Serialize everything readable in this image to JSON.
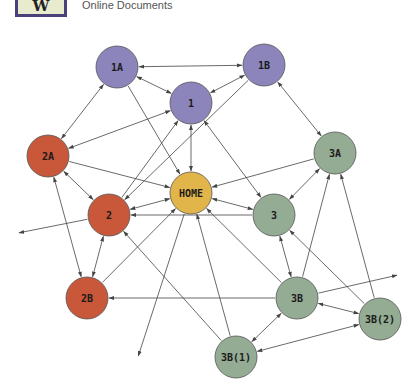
{
  "header": {
    "logo_letter": "W",
    "subtitle": "Online Documents"
  },
  "colors": {
    "purple": "#8c85bb",
    "red": "#c9573a",
    "yellow": "#e2b54a",
    "green": "#93ac93",
    "edge": "#444444",
    "outline": "#555555"
  },
  "nodes": [
    {
      "id": "1A",
      "label": "1A",
      "x": 117,
      "y": 67,
      "color": "purple"
    },
    {
      "id": "1B",
      "label": "1B",
      "x": 264,
      "y": 65,
      "color": "purple"
    },
    {
      "id": "1",
      "label": "1",
      "x": 191,
      "y": 103,
      "color": "purple"
    },
    {
      "id": "2A",
      "label": "2A",
      "x": 48,
      "y": 156,
      "color": "red"
    },
    {
      "id": "3A",
      "label": "3A",
      "x": 335,
      "y": 153,
      "color": "green"
    },
    {
      "id": "HOME",
      "label": "HOME",
      "x": 191,
      "y": 193,
      "color": "yellow"
    },
    {
      "id": "2",
      "label": "2",
      "x": 109,
      "y": 215,
      "color": "red"
    },
    {
      "id": "3",
      "label": "3",
      "x": 274,
      "y": 215,
      "color": "green"
    },
    {
      "id": "2B",
      "label": "2B",
      "x": 87,
      "y": 298,
      "color": "red"
    },
    {
      "id": "3B",
      "label": "3B",
      "x": 297,
      "y": 298,
      "color": "green"
    },
    {
      "id": "3B(2)",
      "label": "3B(2)",
      "x": 380,
      "y": 319,
      "color": "green"
    },
    {
      "id": "3B(1)",
      "label": "3B(1)",
      "x": 236,
      "y": 357,
      "color": "green"
    }
  ],
  "edges": [
    {
      "from": "1B",
      "to": "1A",
      "type": "both"
    },
    {
      "from": "1A",
      "to": "1",
      "type": "both"
    },
    {
      "from": "1B",
      "to": "1",
      "type": "both"
    },
    {
      "from": "1A",
      "to": "2A",
      "type": "both"
    },
    {
      "from": "1A",
      "to": "HOME",
      "type": "to"
    },
    {
      "from": "2A",
      "to": "1",
      "type": "both"
    },
    {
      "from": "1",
      "to": "HOME",
      "type": "both"
    },
    {
      "from": "1B",
      "to": "3A",
      "type": "both"
    },
    {
      "from": "1B",
      "to": "2",
      "type": "to"
    },
    {
      "from": "1",
      "to": "3",
      "type": "both"
    },
    {
      "from": "2A",
      "to": "HOME",
      "type": "to"
    },
    {
      "from": "2A",
      "to": "2",
      "type": "both"
    },
    {
      "from": "3A",
      "to": "HOME",
      "type": "to"
    },
    {
      "from": "3A",
      "to": "3",
      "type": "both"
    },
    {
      "from": "HOME",
      "to": "2",
      "type": "both"
    },
    {
      "from": "HOME",
      "to": "3",
      "type": "both"
    },
    {
      "from": "2",
      "to": "1",
      "type": "to"
    },
    {
      "from": "3",
      "to": "2",
      "type": "to"
    },
    {
      "from": "2",
      "to": "ext-left",
      "type": "to"
    },
    {
      "from": "2B",
      "to": "2A",
      "type": "both"
    },
    {
      "from": "2B",
      "to": "2",
      "type": "both"
    },
    {
      "from": "2B",
      "to": "HOME",
      "type": "to"
    },
    {
      "from": "3B",
      "to": "2B",
      "type": "to"
    },
    {
      "from": "3B",
      "to": "3",
      "type": "both"
    },
    {
      "from": "3B",
      "to": "3A",
      "type": "to"
    },
    {
      "from": "3B",
      "to": "HOME",
      "type": "to"
    },
    {
      "from": "3B",
      "to": "ext-right",
      "type": "to"
    },
    {
      "from": "3B",
      "to": "3B(2)",
      "type": "both"
    },
    {
      "from": "3B",
      "to": "3B(1)",
      "type": "both"
    },
    {
      "from": "3B(2)",
      "to": "3A",
      "type": "to"
    },
    {
      "from": "3B(2)",
      "to": "3",
      "type": "to"
    },
    {
      "from": "3B(2)",
      "to": "3B(1)",
      "type": "both"
    },
    {
      "from": "3B(1)",
      "to": "HOME",
      "type": "to"
    },
    {
      "from": "3B(1)",
      "to": "2",
      "type": "to"
    },
    {
      "from": "HOME",
      "to": "ext-bottom",
      "type": "to"
    }
  ],
  "external_points": {
    "ext-left": {
      "x": 18,
      "y": 233
    },
    "ext-right": {
      "x": 398,
      "y": 275
    },
    "ext-bottom": {
      "x": 138,
      "y": 357
    }
  }
}
